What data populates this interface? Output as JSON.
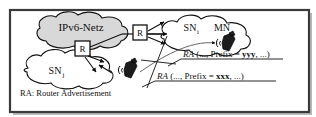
{
  "figure": {
    "frame_border_color": "#3a3a3a",
    "background_color": "#ffffff",
    "shadow_color": "#b9b9b9"
  },
  "clouds": [
    {
      "id": "ipv6-netz",
      "label": "IPv6-Netz",
      "fill": "#d8d8d8",
      "stroke": "#111111"
    },
    {
      "id": "sn-i",
      "label": "SN",
      "subscript": "i",
      "fill": "#ffffff",
      "stroke": "#111111"
    },
    {
      "id": "sn-j",
      "label": "SN",
      "subscript": "j",
      "fill": "#ffffff",
      "stroke": "#111111"
    }
  ],
  "nodes": {
    "mobile_node_label": "MN",
    "router_label": "R"
  },
  "routers": [
    {
      "id": "router-left",
      "label": "R"
    },
    {
      "id": "router-right",
      "label": "R"
    }
  ],
  "devices": [
    {
      "id": "mobile-node-sn-i",
      "name": "mobile-phone"
    },
    {
      "id": "mobile-node-sn-j",
      "name": "mobile-phone"
    }
  ],
  "annotations": [
    {
      "id": "ra-yyy",
      "prefix_keyword": "RA",
      "open": " (..., Prefix = ",
      "value": "yyy",
      "close": ", ...)"
    },
    {
      "id": "ra-xxx",
      "prefix_keyword": "RA",
      "open": " (..., Prefix = ",
      "value": "xxx",
      "close": ", ...)"
    }
  ],
  "legend": {
    "text": "RA: Router Advertisement"
  }
}
